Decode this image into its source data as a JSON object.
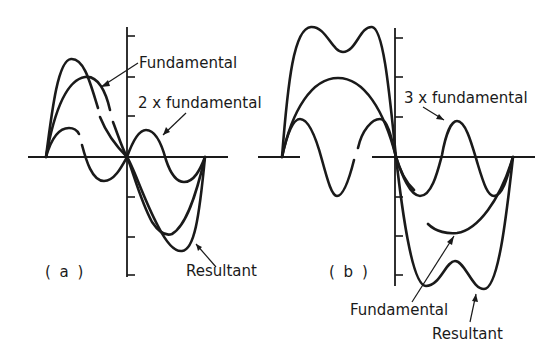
{
  "figure": {
    "panel_a": {
      "panel_label": "( a )",
      "labels": {
        "fundamental": "Fundamental",
        "harmonic": "2 x fundamental",
        "resultant": "Resultant"
      }
    },
    "panel_b": {
      "panel_label": "( b )",
      "labels": {
        "harmonic": "3 x fundamental",
        "fundamental": "Fundamental",
        "resultant": "Resultant"
      }
    },
    "colors": {
      "ink": "#1a1a1a",
      "background": "#ffffff"
    }
  }
}
